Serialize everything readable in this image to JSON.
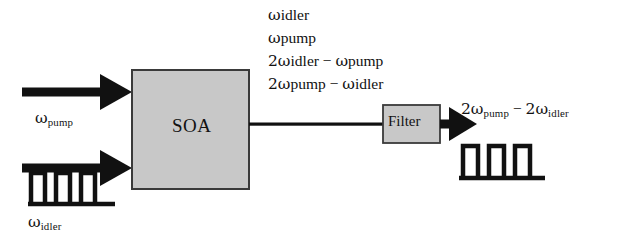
{
  "figure": {
    "background_color": "#ffffff",
    "stroke_color": "#111111",
    "box_fill_color": "#c8c8c8",
    "box_border_color": "#3a3a3a"
  },
  "blocks": {
    "soa": {
      "label": "SOA",
      "x": 132,
      "y": 70,
      "w": 117,
      "h": 119
    },
    "filter": {
      "label": "Filter",
      "x": 383,
      "y": 105,
      "w": 57,
      "h": 38
    }
  },
  "inputs": {
    "pump": {
      "label_omega": "ω",
      "label_sub": "pump"
    },
    "idler": {
      "label_omega": "ω",
      "label_sub": "idler"
    }
  },
  "annotation": {
    "lines": [
      {
        "text": "ω",
        "sub": "idler",
        "full": "ωidler"
      },
      {
        "text": "ω",
        "sub": "pump",
        "full": "ωpump"
      },
      {
        "text": "2ω",
        "sub": "idler",
        "op": " − ",
        "text2": "ω",
        "sub2": "pump",
        "full": "2ωidler − ωpump"
      },
      {
        "text": "2ω",
        "sub": "pump",
        "op": " − ",
        "text2": "ω",
        "sub2": "idler",
        "full": "2ωpump − ωidler"
      }
    ]
  },
  "output": {
    "text": "2ω",
    "sub": "pump",
    "op": " − ",
    "text2": "2ω",
    "sub2": "idler",
    "full": "2ωpump − 2ωidler"
  },
  "pulse_trains": {
    "input_idler": {
      "count": 3,
      "baseline_y": 204,
      "top_y": 172,
      "start_x": 28,
      "pulse_w": 14,
      "gap": 11,
      "baseline_x2": 115
    },
    "output": {
      "count": 3,
      "baseline_y": 178,
      "top_y": 145,
      "start_x": 462,
      "pulse_w": 15,
      "gap": 11,
      "baseline_x2": 545
    }
  },
  "arrows": {
    "pump_in": {
      "x1": 22,
      "y": 92,
      "x2": 132,
      "shaft": 9
    },
    "idler_in": {
      "x1": 22,
      "y": 168,
      "x2": 132,
      "shaft": 9
    },
    "soa_to_filter": {
      "x1": 249,
      "y": 124,
      "x2": 383,
      "shaft": 3
    },
    "filter_out": {
      "x1": 440,
      "y": 124,
      "x2": 466,
      "shaft": 9
    }
  }
}
